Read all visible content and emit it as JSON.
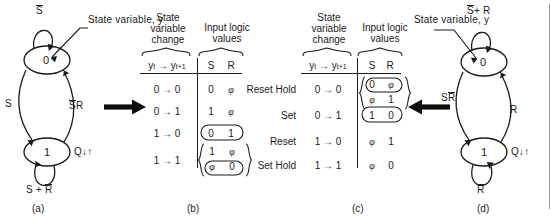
{
  "figure": {
    "panels": [
      "(a)",
      "(b)",
      "(c)",
      "(d)"
    ]
  },
  "captions": {
    "a": "(a)",
    "b": "(b)",
    "c": "(c)",
    "d": "(d)"
  },
  "diagram_a": {
    "state_top": "0",
    "state_bottom": "1",
    "annotation": "State variable, y",
    "self_loop_top": "S̅",
    "self_loop_bottom": "S + R̅",
    "edge_down": "S",
    "edge_up": "S̅R",
    "output_label": "Q↓↑",
    "self_loop_top_plain": "S",
    "self_loop_bottom_plain_left": "S",
    "self_loop_bottom_plain_right": "R",
    "edge_up_over": "S",
    "edge_up_plain": "R"
  },
  "diagram_d": {
    "state_top": "0",
    "state_bottom": "1",
    "annotation": "State variable, y",
    "self_loop_top": "S̅ + R",
    "self_loop_bottom": "R̅",
    "edge_down": "SR̅",
    "edge_up": "R",
    "output_label": "Q↓↑",
    "self_loop_top_over": "S",
    "self_loop_top_plain": "+ R",
    "self_loop_bottom_over": "R",
    "edge_down_plain": "S",
    "edge_down_over": "R"
  },
  "table_b": {
    "header_left_line1": "State",
    "header_left_line2": "variable",
    "header_left_line3": "change",
    "header_right_line1": "Input logic",
    "header_right_line2": "values",
    "col_state": "yₜ → yₜ₊₁",
    "col_state_y": "y",
    "col_state_sub1": "t",
    "col_state_sub2": "t+1",
    "col_s": "S",
    "col_r": "R",
    "rows": [
      {
        "change": "0 → 0",
        "s": "0",
        "r": "φ",
        "highlight": "none",
        "label": ""
      },
      {
        "change": "0 → 1",
        "s": "1",
        "r": "φ",
        "highlight": "none",
        "label": ""
      },
      {
        "change": "1 → 0",
        "s": "0",
        "r": "1",
        "highlight": "oval",
        "label": ""
      },
      {
        "change": "1 → 1",
        "s": "1",
        "r": "φ",
        "s2": "φ",
        "r2": "0",
        "highlight": "brace-oval",
        "label": ""
      }
    ]
  },
  "table_c": {
    "header_left_line1": "State",
    "header_left_line2": "variable",
    "header_left_line3": "change",
    "header_right_line1": "Input logic",
    "header_right_line2": "values",
    "col_state": "yₜ → yₜ₊₁",
    "col_state_y": "y",
    "col_state_sub1": "t",
    "col_state_sub2": "t+1",
    "col_s": "S",
    "col_r": "R",
    "rows": [
      {
        "change": "0 → 0",
        "s": "0",
        "r": "φ",
        "s2": "φ",
        "r2": "1",
        "highlight": "brace-oval"
      },
      {
        "change": "0 → 1",
        "s": "1",
        "r": "0",
        "highlight": "oval"
      },
      {
        "change": "1 → 0",
        "s": "φ",
        "r": "1",
        "highlight": "none"
      },
      {
        "change": "1 → 1",
        "s": "φ",
        "r": "0",
        "highlight": "none"
      }
    ]
  },
  "mid_labels": {
    "items": [
      "Reset Hold",
      "Set",
      "Reset",
      "Set Hold"
    ]
  },
  "arrows": {
    "left_to_right": "→",
    "right_to_left": "←"
  },
  "colors": {
    "ink": "#1a1a1a",
    "rule": "#9a9a9a"
  }
}
